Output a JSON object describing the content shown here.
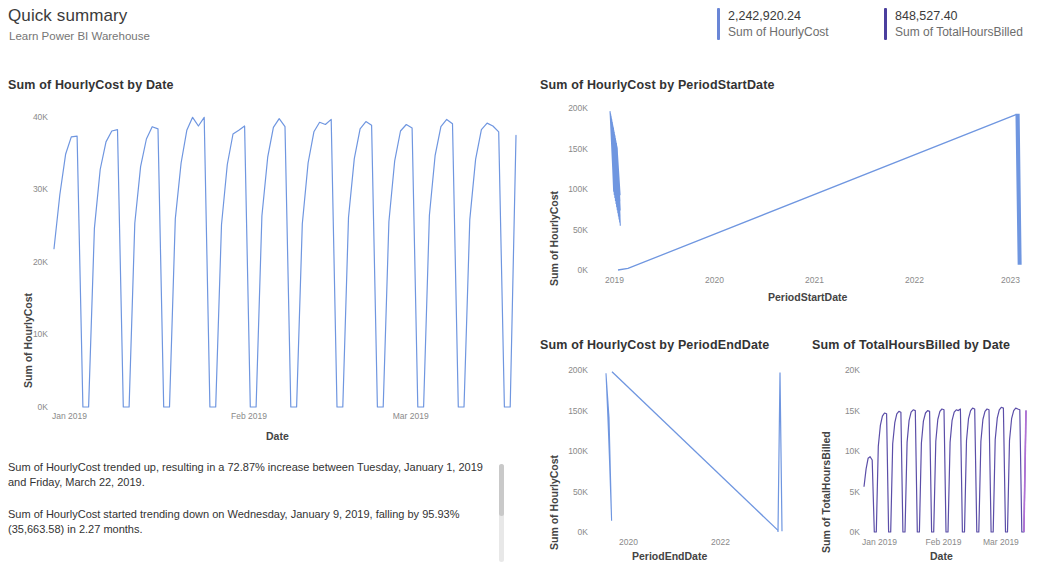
{
  "header": {
    "title": "Quick summary",
    "subtitle": "Learn Power BI Warehouse"
  },
  "kpis": [
    {
      "value": "2,242,920.24",
      "label": "Sum of HourlyCost",
      "color": "#6a86d6"
    },
    {
      "value": "848,527.40",
      "label": "Sum of TotalHoursBilled",
      "color": "#4b3f9e"
    }
  ],
  "narrative": {
    "paragraph1": "Sum of HourlyCost trended up, resulting in a 72.87% increase between Tuesday, January 1, 2019 and Friday, March 22, 2019.",
    "paragraph2": "Sum of HourlyCost started trending down on Wednesday, January 9, 2019, falling by 95.93% (35,663.58) in 2.27 months."
  },
  "chart_data": [
    {
      "id": "hourlycost_by_date",
      "type": "line",
      "title": "Sum of HourlyCost by Date",
      "xlabel": "Date",
      "ylabel": "Sum of HourlyCost",
      "ylim": [
        0,
        42000
      ],
      "yticks": [
        0,
        10000,
        20000,
        30000,
        40000
      ],
      "ytick_labels": [
        "0K",
        "10K",
        "20K",
        "30K",
        "40K"
      ],
      "xticks": [
        0,
        31,
        59
      ],
      "xtick_labels": [
        "Jan 2019",
        "Feb 2019",
        "Mar 2019"
      ],
      "grid": false,
      "line_color": "#6f96e0",
      "series": [
        {
          "name": "Sum of HourlyCost",
          "x": [
            0,
            1,
            2,
            3,
            4,
            5,
            6,
            7,
            8,
            9,
            10,
            11,
            12,
            13,
            14,
            15,
            16,
            17,
            18,
            19,
            20,
            21,
            22,
            23,
            24,
            25,
            26,
            27,
            28,
            29,
            30,
            31,
            32,
            33,
            34,
            35,
            36,
            37,
            38,
            39,
            40,
            41,
            42,
            43,
            44,
            45,
            46,
            47,
            48,
            49,
            50,
            51,
            52,
            53,
            54,
            55,
            56,
            57,
            58,
            59,
            60,
            61,
            62,
            63,
            64,
            65,
            66,
            67,
            68,
            69,
            70,
            71,
            72,
            73,
            74,
            75,
            76,
            77,
            78,
            79,
            80
          ],
          "values": [
            21800,
            29200,
            34800,
            37200,
            37300,
            0,
            0,
            24600,
            32700,
            36500,
            38000,
            38200,
            0,
            0,
            25300,
            33100,
            36900,
            38600,
            38300,
            0,
            0,
            25900,
            33600,
            38100,
            39900,
            38700,
            39900,
            0,
            0,
            25100,
            33400,
            37600,
            38100,
            38700,
            0,
            0,
            26300,
            34400,
            38500,
            39700,
            38600,
            0,
            0,
            25200,
            33600,
            37900,
            39200,
            38900,
            39600,
            0,
            0,
            26100,
            34200,
            38300,
            39300,
            38800,
            0,
            0,
            25500,
            33900,
            38000,
            38900,
            38400,
            0,
            0,
            26400,
            34600,
            38600,
            39600,
            39000,
            0,
            0,
            25800,
            34100,
            38200,
            39100,
            38700,
            37900,
            0,
            0,
            37400
          ]
        }
      ]
    },
    {
      "id": "hourlycost_by_periodstartdate",
      "type": "line",
      "title": "Sum of HourlyCost by PeriodStartDate",
      "xlabel": "PeriodStartDate",
      "ylabel": "Sum of HourlyCost",
      "ylim": [
        0,
        210000
      ],
      "yticks": [
        0,
        50000,
        100000,
        150000,
        200000
      ],
      "ytick_labels": [
        "0K",
        "50K",
        "100K",
        "150K",
        "200K"
      ],
      "xticks": [
        2019,
        2020,
        2021,
        2022,
        2023
      ],
      "xtick_labels": [
        "2019",
        "2020",
        "2021",
        "2022",
        "2023"
      ],
      "grid": false,
      "line_color": "#6f96e0",
      "description": "Dense oscillating cluster near 2019 reaching 200K, then a straight rising ramp from near 0K at early 2019 to 200K at 2023, ending in a dense vertical cluster at 2023."
    },
    {
      "id": "hourlycost_by_periodenddate",
      "type": "line",
      "title": "Sum of HourlyCost by PeriodEndDate",
      "xlabel": "PeriodEndDate",
      "ylabel": "Sum of HourlyCost",
      "ylim": [
        0,
        210000
      ],
      "yticks": [
        0,
        50000,
        100000,
        150000,
        200000
      ],
      "ytick_labels": [
        "0K",
        "50K",
        "100K",
        "150K",
        "200K"
      ],
      "xticks": [
        2020,
        2022
      ],
      "xtick_labels": [
        "2020",
        "2022"
      ],
      "grid": false,
      "line_color": "#6f96e0",
      "description": "Dense vertical cluster rising to 200K at the left, a straight descending line falling to 0K near 2022-2023, then a vertical spike back up to 200K at the right edge."
    },
    {
      "id": "totalhoursbilled_by_date",
      "type": "line",
      "title": "Sum of TotalHoursBilled by Date",
      "xlabel": "Date",
      "ylabel": "Sum of TotalHoursBilled",
      "ylim": [
        0,
        21000
      ],
      "yticks": [
        0,
        5000,
        10000,
        15000,
        20000
      ],
      "ytick_labels": [
        "0K",
        "5K",
        "10K",
        "15K",
        "20K"
      ],
      "xticks": [
        0,
        31,
        59
      ],
      "xtick_labels": [
        "Jan 2019",
        "Feb 2019",
        "Mar 2019"
      ],
      "grid": false,
      "line_color": "#5b4ea8",
      "accent_color": "#b36fd6",
      "series": [
        {
          "name": "Sum of TotalHoursBilled",
          "x": [
            0,
            1,
            2,
            3,
            4,
            5,
            6,
            7,
            8,
            9,
            10,
            11,
            12,
            13,
            14,
            15,
            16,
            17,
            18,
            19,
            20,
            21,
            22,
            23,
            24,
            25,
            26,
            27,
            28,
            29,
            30,
            31,
            32,
            33,
            34,
            35,
            36,
            37,
            38,
            39,
            40,
            41,
            42,
            43,
            44,
            45,
            46,
            47,
            48,
            49,
            50,
            51,
            52,
            53,
            54,
            55,
            56,
            57,
            58,
            59,
            60,
            61,
            62,
            63,
            64,
            65,
            66,
            67,
            68,
            69,
            70,
            71,
            72,
            73,
            74,
            75,
            76,
            77,
            78,
            79,
            80
          ],
          "values": [
            5600,
            7800,
            9100,
            9300,
            8900,
            0,
            0,
            10600,
            13200,
            14300,
            14700,
            14600,
            0,
            0,
            10900,
            13500,
            14600,
            14900,
            14800,
            0,
            0,
            11100,
            13800,
            14800,
            15100,
            15000,
            0,
            0,
            11000,
            13700,
            14700,
            15000,
            14900,
            0,
            0,
            11200,
            13900,
            14900,
            15200,
            15100,
            0,
            0,
            11100,
            13800,
            14800,
            15100,
            15000,
            15200,
            0,
            0,
            11300,
            14000,
            15000,
            15300,
            15200,
            0,
            0,
            11200,
            13900,
            14900,
            15200,
            15100,
            0,
            0,
            11400,
            14100,
            15100,
            15400,
            15300,
            0,
            0,
            11300,
            14000,
            15000,
            15300,
            15200,
            15100,
            0,
            0,
            15000
          ]
        }
      ]
    }
  ]
}
